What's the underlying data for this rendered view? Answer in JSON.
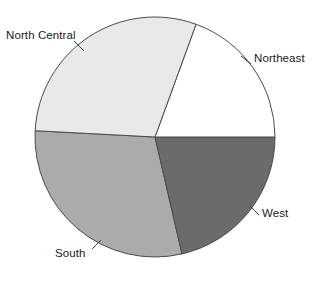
{
  "chart_data": {
    "type": "pie",
    "title": "",
    "subtitle": "",
    "xlabel": "",
    "ylabel": "",
    "legend_position": "none",
    "grid": false,
    "labels_placement": "outside-with-leader-lines",
    "categories": [
      "Northeast",
      "West",
      "South",
      "North Central"
    ],
    "values": [
      21.4,
      19.4,
      29.7,
      29.5
    ],
    "units": "percent",
    "slices": [
      {
        "label": "Northeast",
        "value": 21.4,
        "start_angle_deg": 167,
        "end_angle_deg": 360,
        "sweep_deg": 77,
        "color": "#6b6b6b",
        "edge_color": "#4a4a4a"
      },
      {
        "label": "West",
        "value": 19.4,
        "start_angle_deg": 0,
        "end_angle_deg": 70,
        "sweep_deg": 70,
        "color": "#ffffff",
        "edge_color": "#4a4a4a"
      },
      {
        "label": "South",
        "value": 29.7,
        "start_angle_deg": 70,
        "end_angle_deg": 177,
        "sweep_deg": 107,
        "color": "#e9e9e9",
        "edge_color": "#4a4a4a"
      },
      {
        "label": "North Central",
        "value": 29.5,
        "start_angle_deg": 177,
        "end_angle_deg": 283,
        "sweep_deg": 106,
        "color": "#ababab",
        "edge_color": "#4a4a4a"
      }
    ]
  },
  "figure": {
    "background_color": "#ffffff",
    "center_x": 155,
    "center_y": 137,
    "radius": 120
  },
  "labels": {
    "north_central": "North Central",
    "northeast": "Northeast",
    "west": "West",
    "south": "South"
  }
}
